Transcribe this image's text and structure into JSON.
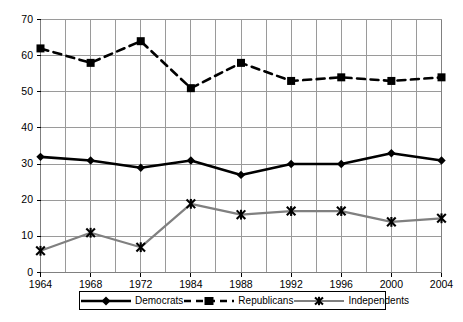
{
  "chart_data": {
    "type": "line",
    "title": "",
    "subtitle": "",
    "xlabel": "",
    "ylabel": "",
    "x": [
      "1964",
      "1968",
      "1972",
      "1984",
      "1988",
      "1992",
      "1996",
      "2000",
      "2004"
    ],
    "categories": [
      "1964",
      "1968",
      "1972",
      "1984",
      "1988",
      "1992",
      "1996",
      "2000",
      "2004"
    ],
    "ylim": [
      0,
      70
    ],
    "yticks": [
      0,
      10,
      20,
      30,
      40,
      50,
      60,
      70
    ],
    "ytick_labels": [
      "0",
      "10",
      "20",
      "30",
      "40",
      "50",
      "60",
      "70"
    ],
    "grid": true,
    "grid_major_vertical": true,
    "grid_minor_vertical": true,
    "legend_position": "bottom",
    "series": [
      {
        "name": "Democrats",
        "color": "#000000",
        "marker": "diamond",
        "line_style": "solid",
        "values": [
          32,
          31,
          29,
          31,
          27,
          30,
          30,
          33,
          31
        ]
      },
      {
        "name": "Republicans",
        "color": "#000000",
        "marker": "square",
        "line_style": "dashed",
        "values": [
          62,
          58,
          64,
          51,
          58,
          53,
          54,
          53,
          54
        ]
      },
      {
        "name": "Independents",
        "color": "#808080",
        "marker": "star-x",
        "line_style": "solid",
        "values": [
          6,
          11,
          7,
          19,
          16,
          17,
          17,
          14,
          15
        ]
      }
    ]
  },
  "axes": {
    "y_tick_labels": [
      "70",
      "60",
      "50",
      "40",
      "30",
      "20",
      "10",
      "0"
    ],
    "x_tick_labels": [
      "1964",
      "1968",
      "1972",
      "1984",
      "1988",
      "1992",
      "1996",
      "2000",
      "2004"
    ]
  },
  "legend": {
    "items": [
      {
        "label": "Democrats"
      },
      {
        "label": "Republicans"
      },
      {
        "label": "Independents"
      }
    ]
  },
  "colors": {
    "series_dark": "#000000",
    "series_gray": "#808080",
    "grid": "#9a9a9a",
    "axis": "#808080",
    "background": "#ffffff"
  }
}
